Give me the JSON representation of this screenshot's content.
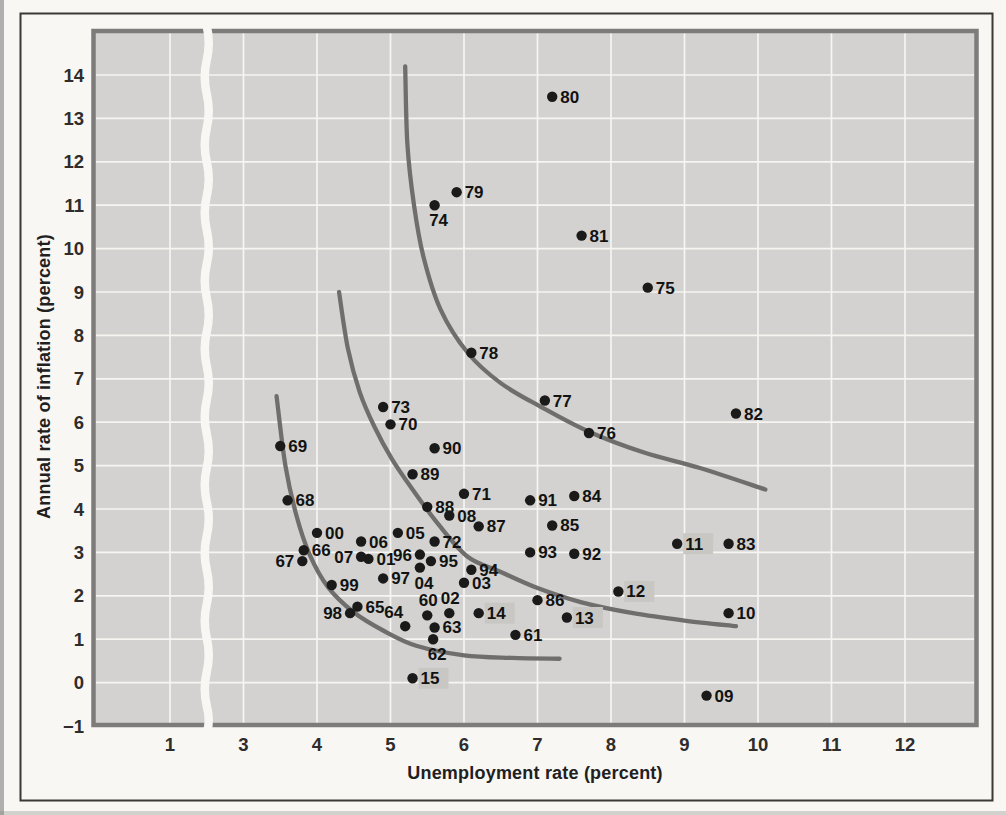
{
  "figure": {
    "kind": "textbook-scatter-figure",
    "x_axis_title": "Unemployment rate (percent)",
    "y_axis_title": "Annual rate of inflation (percent)"
  },
  "colors": {
    "page": "#f8f7f4",
    "outer_border": "#3a3936",
    "plot_background": "#d3d2d0",
    "plot_frame": "#7d7c7a",
    "gridline": "#f6f5f2",
    "curve": "#6f6e6c",
    "point": "#1a1a1a",
    "point_label": "#121212",
    "highlight_badge": "#c8c7c4",
    "tick_label": "#2e2d2b",
    "scan_edge": "#8a8987"
  },
  "chart_data": {
    "type": "scatter",
    "title": "",
    "xlabel": "Unemployment rate (percent)",
    "ylabel": "Annual rate of inflation (percent)",
    "xlim": [
      0.5,
      13
    ],
    "ylim": [
      -1,
      15
    ],
    "grid": true,
    "x_axis_break": {
      "between": [
        1,
        3
      ],
      "omitted_value": 2
    },
    "x_ticks": [
      {
        "value": 1,
        "label": "1"
      },
      {
        "value": 3,
        "label": "3"
      },
      {
        "value": 4,
        "label": "4"
      },
      {
        "value": 5,
        "label": "5"
      },
      {
        "value": 6,
        "label": "6"
      },
      {
        "value": 7,
        "label": "7"
      },
      {
        "value": 8,
        "label": "8"
      },
      {
        "value": 9,
        "label": "9"
      },
      {
        "value": 10,
        "label": "10"
      },
      {
        "value": 11,
        "label": "11"
      },
      {
        "value": 12,
        "label": "12"
      }
    ],
    "y_ticks": [
      {
        "value": 14,
        "label": "14"
      },
      {
        "value": 13,
        "label": "13"
      },
      {
        "value": 12,
        "label": "12"
      },
      {
        "value": 11,
        "label": "11"
      },
      {
        "value": 10,
        "label": "10"
      },
      {
        "value": 9,
        "label": "9"
      },
      {
        "value": 8,
        "label": "8"
      },
      {
        "value": 7,
        "label": "7"
      },
      {
        "value": 6,
        "label": "6"
      },
      {
        "value": 5,
        "label": "5"
      },
      {
        "value": 4,
        "label": "4"
      },
      {
        "value": 3,
        "label": "3"
      },
      {
        "value": 2,
        "label": "2"
      },
      {
        "value": 1,
        "label": "1"
      },
      {
        "value": 0,
        "label": "0"
      },
      {
        "value": -1,
        "label": "−1"
      }
    ],
    "points": [
      {
        "year": "60",
        "x": 5.5,
        "y": 1.55,
        "label_pos": "above",
        "highlight": false
      },
      {
        "year": "61",
        "x": 6.7,
        "y": 1.1,
        "label_pos": "right",
        "highlight": false
      },
      {
        "year": "62",
        "x": 5.58,
        "y": 1.0,
        "label_pos": "below",
        "highlight": false
      },
      {
        "year": "63",
        "x": 5.6,
        "y": 1.27,
        "label_pos": "right",
        "highlight": false
      },
      {
        "year": "64",
        "x": 5.2,
        "y": 1.3,
        "label_pos": "above-left",
        "highlight": false
      },
      {
        "year": "65",
        "x": 4.55,
        "y": 1.75,
        "label_pos": "right",
        "highlight": false
      },
      {
        "year": "66",
        "x": 3.82,
        "y": 3.05,
        "label_pos": "right",
        "highlight": false
      },
      {
        "year": "67",
        "x": 3.8,
        "y": 2.8,
        "label_pos": "left",
        "highlight": false
      },
      {
        "year": "68",
        "x": 3.6,
        "y": 4.2,
        "label_pos": "right",
        "highlight": false
      },
      {
        "year": "69",
        "x": 3.5,
        "y": 5.45,
        "label_pos": "right",
        "highlight": false
      },
      {
        "year": "70",
        "x": 5.0,
        "y": 5.95,
        "label_pos": "right",
        "highlight": false
      },
      {
        "year": "71",
        "x": 6.0,
        "y": 4.35,
        "label_pos": "right",
        "highlight": false
      },
      {
        "year": "72",
        "x": 5.6,
        "y": 3.25,
        "label_pos": "right",
        "highlight": false
      },
      {
        "year": "73",
        "x": 4.9,
        "y": 6.35,
        "label_pos": "right",
        "highlight": false
      },
      {
        "year": "74",
        "x": 5.6,
        "y": 11.0,
        "label_pos": "below",
        "highlight": false
      },
      {
        "year": "75",
        "x": 8.5,
        "y": 9.1,
        "label_pos": "right",
        "highlight": false
      },
      {
        "year": "76",
        "x": 7.7,
        "y": 5.75,
        "label_pos": "right",
        "highlight": false
      },
      {
        "year": "77",
        "x": 7.1,
        "y": 6.5,
        "label_pos": "right",
        "highlight": false
      },
      {
        "year": "78",
        "x": 6.1,
        "y": 7.6,
        "label_pos": "right",
        "highlight": false
      },
      {
        "year": "79",
        "x": 5.9,
        "y": 11.3,
        "label_pos": "right",
        "highlight": false
      },
      {
        "year": "80",
        "x": 7.2,
        "y": 13.5,
        "label_pos": "right",
        "highlight": false
      },
      {
        "year": "81",
        "x": 7.6,
        "y": 10.3,
        "label_pos": "right",
        "highlight": false
      },
      {
        "year": "82",
        "x": 9.7,
        "y": 6.2,
        "label_pos": "right",
        "highlight": false
      },
      {
        "year": "83",
        "x": 9.6,
        "y": 3.2,
        "label_pos": "right",
        "highlight": false
      },
      {
        "year": "84",
        "x": 7.5,
        "y": 4.3,
        "label_pos": "right",
        "highlight": false
      },
      {
        "year": "85",
        "x": 7.2,
        "y": 3.62,
        "label_pos": "right",
        "highlight": false
      },
      {
        "year": "86",
        "x": 7.0,
        "y": 1.9,
        "label_pos": "right",
        "highlight": false
      },
      {
        "year": "87",
        "x": 6.2,
        "y": 3.6,
        "label_pos": "right",
        "highlight": false
      },
      {
        "year": "88",
        "x": 5.5,
        "y": 4.05,
        "label_pos": "right",
        "highlight": false
      },
      {
        "year": "89",
        "x": 5.3,
        "y": 4.8,
        "label_pos": "right",
        "highlight": false
      },
      {
        "year": "90",
        "x": 5.6,
        "y": 5.4,
        "label_pos": "right",
        "highlight": false
      },
      {
        "year": "91",
        "x": 6.9,
        "y": 4.2,
        "label_pos": "right",
        "highlight": false
      },
      {
        "year": "92",
        "x": 7.5,
        "y": 2.97,
        "label_pos": "right",
        "highlight": false
      },
      {
        "year": "93",
        "x": 6.9,
        "y": 3.0,
        "label_pos": "right",
        "highlight": false
      },
      {
        "year": "94",
        "x": 6.1,
        "y": 2.6,
        "label_pos": "right",
        "highlight": false
      },
      {
        "year": "95",
        "x": 5.55,
        "y": 2.8,
        "label_pos": "right",
        "highlight": false
      },
      {
        "year": "96",
        "x": 5.4,
        "y": 2.95,
        "label_pos": "left",
        "highlight": false
      },
      {
        "year": "97",
        "x": 4.9,
        "y": 2.4,
        "label_pos": "right",
        "highlight": false
      },
      {
        "year": "98",
        "x": 4.45,
        "y": 1.6,
        "label_pos": "left",
        "highlight": false
      },
      {
        "year": "99",
        "x": 4.2,
        "y": 2.25,
        "label_pos": "right",
        "highlight": false
      },
      {
        "year": "00",
        "x": 4.0,
        "y": 3.45,
        "label_pos": "right",
        "highlight": false
      },
      {
        "year": "01",
        "x": 4.7,
        "y": 2.85,
        "label_pos": "right",
        "highlight": false
      },
      {
        "year": "02",
        "x": 5.8,
        "y": 1.6,
        "label_pos": "above",
        "highlight": false
      },
      {
        "year": "03",
        "x": 6.0,
        "y": 2.3,
        "label_pos": "right",
        "highlight": false
      },
      {
        "year": "04",
        "x": 5.4,
        "y": 2.65,
        "label_pos": "below",
        "highlight": false
      },
      {
        "year": "05",
        "x": 5.1,
        "y": 3.45,
        "label_pos": "right",
        "highlight": false
      },
      {
        "year": "06",
        "x": 4.6,
        "y": 3.25,
        "label_pos": "right",
        "highlight": false
      },
      {
        "year": "07",
        "x": 4.6,
        "y": 2.9,
        "label_pos": "left",
        "highlight": false
      },
      {
        "year": "08",
        "x": 5.8,
        "y": 3.85,
        "label_pos": "right",
        "highlight": false
      },
      {
        "year": "09",
        "x": 9.3,
        "y": -0.3,
        "label_pos": "right",
        "highlight": false
      },
      {
        "year": "10",
        "x": 9.6,
        "y": 1.6,
        "label_pos": "right",
        "highlight": false
      },
      {
        "year": "11",
        "x": 8.9,
        "y": 3.2,
        "label_pos": "right",
        "highlight": true
      },
      {
        "year": "12",
        "x": 8.1,
        "y": 2.1,
        "label_pos": "right",
        "highlight": true
      },
      {
        "year": "13",
        "x": 7.4,
        "y": 1.5,
        "label_pos": "right",
        "highlight": true
      },
      {
        "year": "14",
        "x": 6.2,
        "y": 1.6,
        "label_pos": "right",
        "highlight": true
      },
      {
        "year": "15",
        "x": 5.3,
        "y": 0.1,
        "label_pos": "right",
        "highlight": true
      }
    ],
    "curves": [
      {
        "name": "phillips-curve-inner",
        "points": [
          [
            3.45,
            6.6
          ],
          [
            3.57,
            5.0
          ],
          [
            3.72,
            3.85
          ],
          [
            3.9,
            2.95
          ],
          [
            4.15,
            2.2
          ],
          [
            4.5,
            1.62
          ],
          [
            4.9,
            1.2
          ],
          [
            5.35,
            0.85
          ],
          [
            6.0,
            0.63
          ],
          [
            6.65,
            0.57
          ],
          [
            7.3,
            0.55
          ]
        ]
      },
      {
        "name": "phillips-curve-middle",
        "points": [
          [
            4.3,
            9.0
          ],
          [
            4.42,
            7.7
          ],
          [
            4.58,
            6.7
          ],
          [
            4.78,
            5.9
          ],
          [
            5.02,
            5.15
          ],
          [
            5.3,
            4.45
          ],
          [
            5.65,
            3.65
          ],
          [
            6.05,
            2.9
          ],
          [
            6.5,
            2.55
          ],
          [
            7.0,
            2.18
          ],
          [
            7.6,
            1.85
          ],
          [
            8.3,
            1.6
          ],
          [
            9.0,
            1.43
          ],
          [
            9.7,
            1.3
          ]
        ]
      },
      {
        "name": "phillips-curve-outer",
        "points": [
          [
            5.2,
            14.2
          ],
          [
            5.23,
            12.4
          ],
          [
            5.32,
            11.0
          ],
          [
            5.45,
            9.8
          ],
          [
            5.68,
            8.6
          ],
          [
            6.05,
            7.6
          ],
          [
            6.5,
            6.9
          ],
          [
            7.05,
            6.35
          ],
          [
            7.7,
            5.78
          ],
          [
            8.45,
            5.3
          ],
          [
            9.2,
            4.95
          ],
          [
            10.1,
            4.45
          ]
        ]
      }
    ],
    "legend": null
  }
}
